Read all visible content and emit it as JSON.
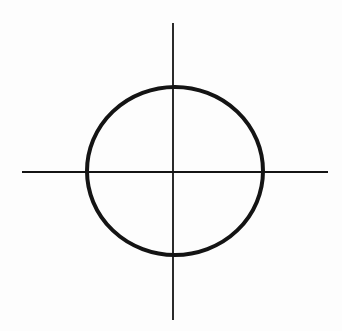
{
  "diagram": {
    "symbol": "crosshair-icon",
    "background": "#fdfdfd",
    "stroke_color": "#141414",
    "vertical_line": {
      "x": 173,
      "y1": 23,
      "y2": 320,
      "width": 1.8
    },
    "horizontal_line": {
      "y": 172,
      "x1": 22,
      "x2": 328,
      "width": 1.8
    },
    "circle": {
      "cx": 175,
      "cy": 171,
      "rx": 88,
      "ry": 84,
      "width": 4
    }
  }
}
